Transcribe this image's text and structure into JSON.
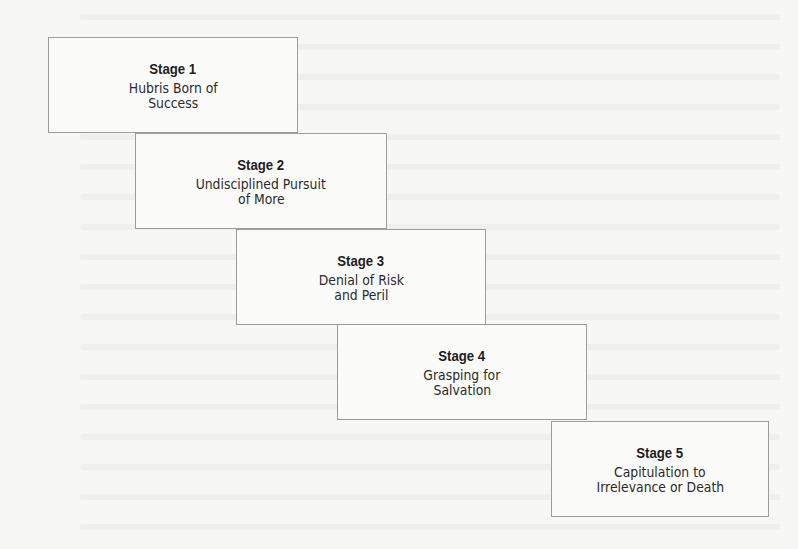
{
  "diagram": {
    "type": "staircase",
    "stages": [
      {
        "title": "Stage 1",
        "lines": [
          "Hubris Born of",
          "Success"
        ],
        "box": {
          "x": 48,
          "y": 37,
          "w": 250,
          "h": 96
        }
      },
      {
        "title": "Stage 2",
        "lines": [
          "Undisciplined Pursuit",
          "of More"
        ],
        "box": {
          "x": 135,
          "y": 133,
          "w": 252,
          "h": 96
        }
      },
      {
        "title": "Stage 3",
        "lines": [
          "Denial of Risk",
          "and Peril"
        ],
        "box": {
          "x": 236,
          "y": 229,
          "w": 250,
          "h": 96
        }
      },
      {
        "title": "Stage 4",
        "lines": [
          "Grasping for",
          "Salvation"
        ],
        "box": {
          "x": 337,
          "y": 324,
          "w": 250,
          "h": 96
        }
      },
      {
        "title": "Stage 5",
        "lines": [
          "Capitulation to",
          "Irrelevance or Death"
        ],
        "box": {
          "x": 551,
          "y": 421,
          "w": 218,
          "h": 96
        }
      }
    ]
  },
  "colors": {
    "background": "#f7f7f5",
    "box_border": "#9c9c9c",
    "box_fill": "#fbfbfa",
    "text": "#1e1e1e"
  }
}
